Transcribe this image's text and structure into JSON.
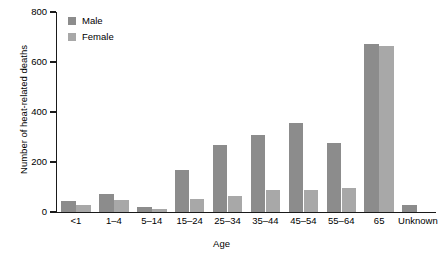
{
  "chart_data": {
    "type": "bar",
    "title": "",
    "xlabel": "Age",
    "ylabel": "Number of heat-related deaths",
    "categories": [
      "<1",
      "1–4",
      "5–14",
      "15–24",
      "25–34",
      "35–44",
      "45–54",
      "55–64",
      "65",
      "Unknown"
    ],
    "series": [
      {
        "name": "Male",
        "color": "#8c8c8c",
        "values": [
          44,
          74,
          20,
          168,
          268,
          310,
          356,
          278,
          674,
          30
        ]
      },
      {
        "name": "Female",
        "color": "#a8a8a8",
        "values": [
          28,
          48,
          12,
          52,
          64,
          90,
          90,
          98,
          666,
          2
        ]
      }
    ],
    "ylim": [
      0,
      800
    ],
    "yticks": [
      0,
      200,
      400,
      600,
      800
    ],
    "ytick_labels": [
      "0",
      "200",
      "400",
      "600",
      "800"
    ],
    "grid": false,
    "legend_position": "top-left"
  },
  "axes": {
    "y_title": "Number of heat-related deaths",
    "x_title": "Age"
  },
  "legend": {
    "entries": [
      {
        "label": "Male"
      },
      {
        "label": "Female"
      }
    ]
  }
}
